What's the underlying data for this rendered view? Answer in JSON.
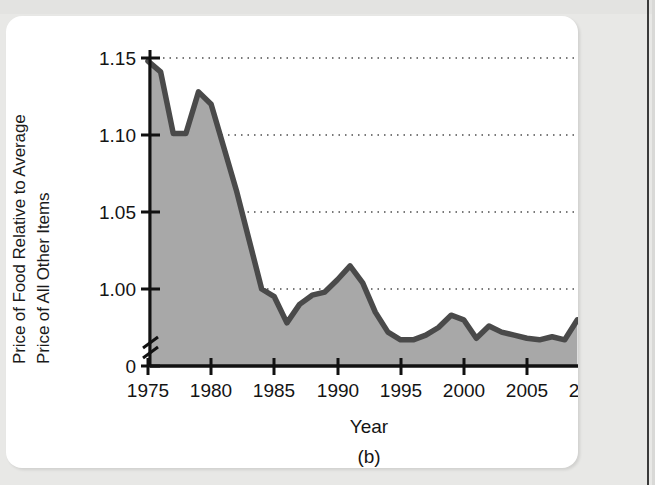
{
  "figure": {
    "panel_label": "(b)",
    "background_color": "#e8e8e6",
    "card_color": "#ffffff",
    "area_fill_color": "#a8a8a8",
    "line_color": "#4a4a4a",
    "axis_color": "#111111",
    "grid_color": "#4d4d4d"
  },
  "chart_data": {
    "type": "area",
    "title": "",
    "subtitle": "",
    "xlabel": "Year",
    "ylabel": "Price of Food Relative to Average Price of All Other Items",
    "ylabel_lines": [
      "Price of Food Relative to Average",
      "Price of All Other Items"
    ],
    "xlim": [
      1975,
      2010
    ],
    "ylim": [
      0.955,
      1.155
    ],
    "axis_break_y": true,
    "y_zero_label": "0",
    "yticks": [
      1.15,
      1.1,
      1.05,
      1.0
    ],
    "ytick_labels": [
      "1.15",
      "1.10",
      "1.05",
      "1.00",
      "0"
    ],
    "xticks": [
      1975,
      1980,
      1985,
      1990,
      1995,
      2000,
      2005,
      2010
    ],
    "xtick_labels": [
      "1975",
      "1980",
      "1985",
      "1990",
      "1995",
      "2000",
      "2005",
      "2010"
    ],
    "grid": "horizontal-dotted",
    "legend": "none",
    "series": [
      {
        "name": "Price of food relative to average price of all other items",
        "x": [
          1975,
          1976,
          1977,
          1978,
          1979,
          1980,
          1981,
          1982,
          1983,
          1984,
          1985,
          1986,
          1987,
          1988,
          1989,
          1990,
          1991,
          1992,
          1993,
          1994,
          1995,
          1996,
          1997,
          1998,
          1999,
          2000,
          2001,
          2002,
          2003,
          2004,
          2005,
          2006,
          2007,
          2008,
          2009
        ],
        "values": [
          1.148,
          1.141,
          1.101,
          1.101,
          1.128,
          1.12,
          1.092,
          1.064,
          1.032,
          1.0,
          0.995,
          0.978,
          0.99,
          0.996,
          0.998,
          1.006,
          1.015,
          1.004,
          0.985,
          0.972,
          0.967,
          0.967,
          0.97,
          0.975,
          0.983,
          0.98,
          0.968,
          0.976,
          0.972,
          0.97,
          0.968,
          0.967,
          0.969,
          0.967,
          0.98
        ]
      }
    ]
  }
}
